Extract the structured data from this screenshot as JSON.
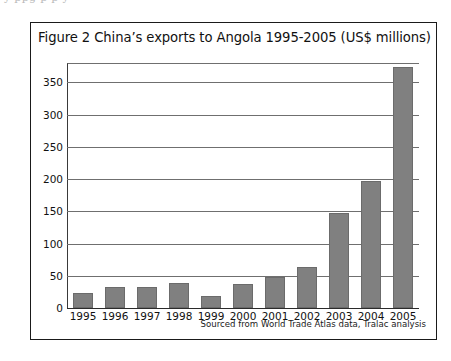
{
  "page": {
    "top_bleed_text": "y                    ppg                              p             p y"
  },
  "figure": {
    "title": "Figure 2 China’s exports to Angola 1995-2005 (US$ millions)",
    "source_note": "Sourced from World Trade Atlas data, Tralac analysis",
    "bar_color": "#808080",
    "border_color": "#1a1a1a",
    "gridline_color": "#6f6f6f",
    "axis_color": "#2b2b2b"
  },
  "chart_data": {
    "type": "bar",
    "title": "Figure 2 China’s exports to Angola 1995-2005 (US$ millions)",
    "xlabel": "",
    "ylabel": "",
    "categories": [
      "1995",
      "1996",
      "1997",
      "1998",
      "1999",
      "2000",
      "2001",
      "2002",
      "2003",
      "2004",
      "2005"
    ],
    "values": [
      24,
      32,
      33,
      39,
      18,
      37,
      48,
      63,
      148,
      197,
      374
    ],
    "ylim": [
      0,
      380
    ],
    "yticks": [
      0,
      50,
      100,
      150,
      200,
      250,
      300,
      350
    ],
    "ytick_labels": [
      "0",
      "50",
      "100",
      "150",
      "200",
      "250",
      "300",
      "350"
    ],
    "grid": true,
    "legend": false,
    "units": "US$ millions",
    "annotations": [
      "Sourced from World Trade Atlas data, Tralac analysis"
    ]
  }
}
